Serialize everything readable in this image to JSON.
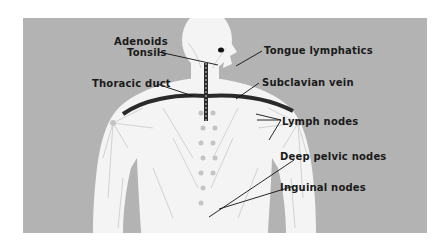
{
  "diagram": {
    "background_color": "#b3b3b3",
    "figure_color": "#f4f4f4",
    "duct_color": "#2a2a2a",
    "labels": [
      {
        "id": "adenoids",
        "text": "Adenoids"
      },
      {
        "id": "tonsils",
        "text": "Tonsils"
      },
      {
        "id": "thoracic-duct",
        "text": "Thoracic duct"
      },
      {
        "id": "tongue-lymphatics",
        "text": "Tongue lymphatics"
      },
      {
        "id": "subclavian-vein",
        "text": "Subclavian vein"
      },
      {
        "id": "lymph-nodes",
        "text": "Lymph nodes"
      },
      {
        "id": "deep-pelvic-nodes",
        "text": "Deep pelvic nodes"
      },
      {
        "id": "inguinal-nodes",
        "text": "Inguinal nodes"
      }
    ]
  }
}
